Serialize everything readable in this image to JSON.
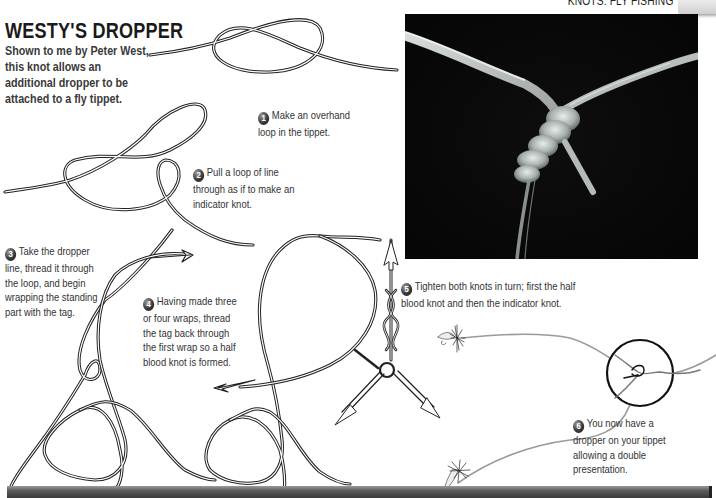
{
  "header": {
    "section": "KNOTS: FLY FISHING"
  },
  "title": "WESTY'S DROPPER",
  "intro": "Shown to me by Peter West, this knot allows an additional dropper to be attached to a fly tippet.",
  "steps": [
    {
      "number": "1",
      "text": "Make an overhand loop in the tippet."
    },
    {
      "number": "2",
      "text": "Pull a loop of line through as if to make an indicator knot."
    },
    {
      "number": "3",
      "text": "Take the dropper line, thread it through the loop, and begin wrapping the standing part with the tag."
    },
    {
      "number": "4",
      "text": "Having made three or four wraps, thread the tag back through the first wrap so a half blood knot is formed."
    },
    {
      "number": "5",
      "text": "Tighten both knots in turn; first the half blood knot and then the indicator knot."
    },
    {
      "number": "6",
      "text": "You now have a dropper on your tippet allowing a double presentation."
    }
  ],
  "photo": {
    "description": "Close-up photo of the finished Westy's Dropper knot on clear monofilament against a black background"
  },
  "colors": {
    "background": "#ffffff",
    "text": "#333333",
    "title": "#1a1a1a",
    "photo_bg": "#070707",
    "footer_bar": "#4a4a4a"
  }
}
